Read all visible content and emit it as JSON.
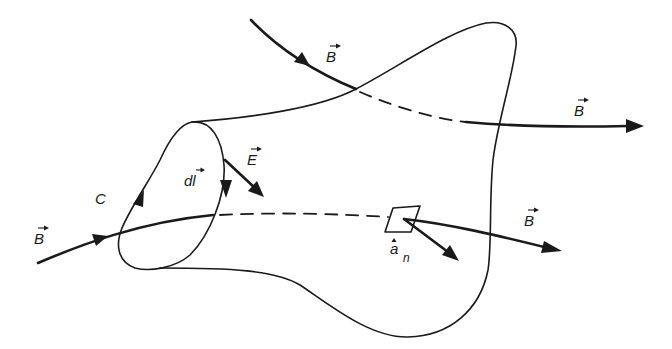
{
  "figure": {
    "labels": {
      "b_top_in": "B",
      "b_top_out": "B",
      "b_left_in": "B",
      "b_right_out": "B",
      "contour": "C",
      "dl": "dl",
      "e_field": "E",
      "normal": "a",
      "normal_sub": "n"
    },
    "colors": {
      "ink": "#1a1a1a",
      "background": "#ffffff"
    }
  }
}
